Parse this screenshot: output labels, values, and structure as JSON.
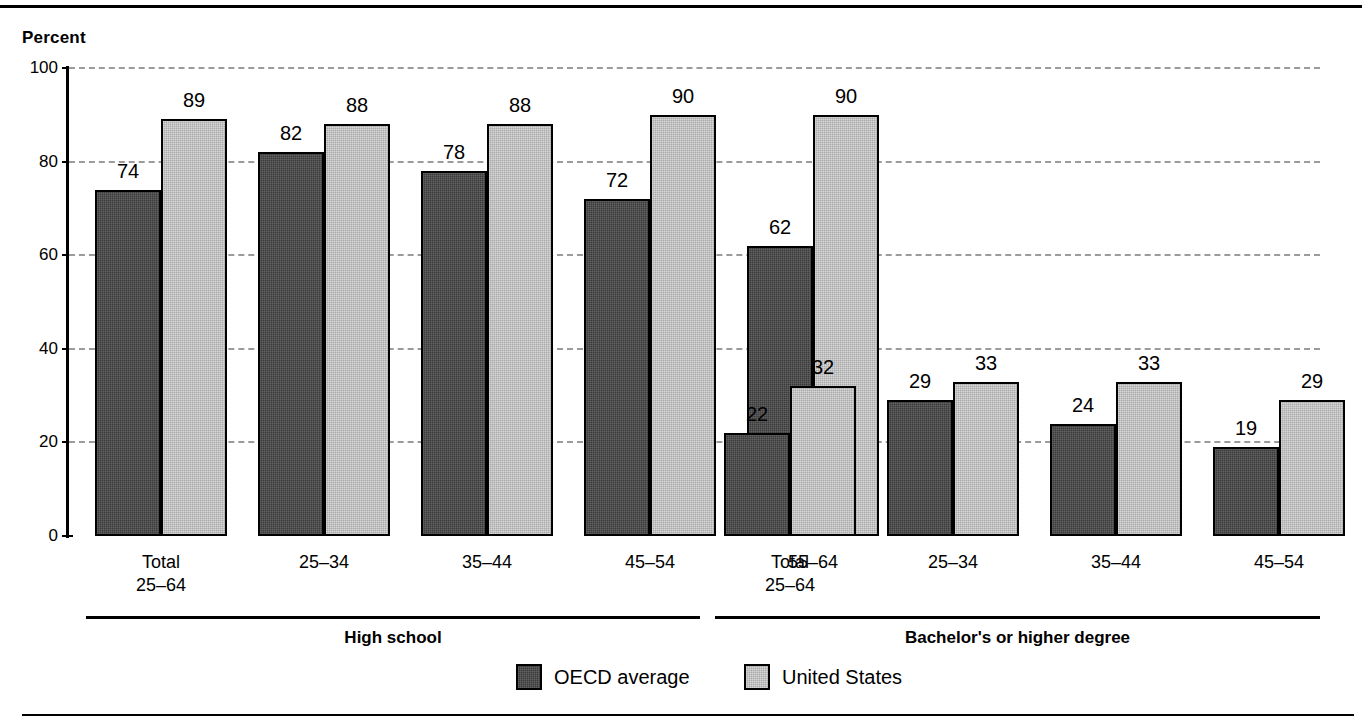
{
  "chart_data": {
    "type": "bar",
    "title": "",
    "xlabel": "",
    "ylabel": "Percent",
    "ylim": [
      0,
      100
    ],
    "yticks": [
      0,
      20,
      40,
      60,
      80,
      100
    ],
    "grid": "horizontal-dashed",
    "legend_position": "bottom-center",
    "categories": [
      "Total\n25–64",
      "25–34",
      "35–44",
      "45–54",
      "55–64",
      "Total\n25–64",
      "25–34",
      "35–44",
      "45–54",
      "55–64"
    ],
    "groups": [
      {
        "label": "High school",
        "categories": [
          "Total 25–64",
          "25–34",
          "35–44",
          "45–54",
          "55–64"
        ]
      },
      {
        "label": "Bachelor's or higher degree",
        "categories": [
          "Total 25–64",
          "25–34",
          "35–44",
          "45–54",
          "55–64"
        ]
      }
    ],
    "series": [
      {
        "name": "OECD average",
        "color": "#3b3b3b",
        "values": [
          74,
          82,
          78,
          72,
          62,
          22,
          29,
          24,
          19,
          16
        ]
      },
      {
        "name": "United States",
        "color": "#a9a9a9",
        "values": [
          89,
          88,
          88,
          90,
          90,
          32,
          33,
          33,
          29,
          32
        ]
      }
    ]
  },
  "axis": {
    "percent_label": "Percent",
    "y_tick_labels": [
      "100",
      "80",
      "60",
      "40",
      "20",
      "0"
    ]
  },
  "categories": [
    {
      "line1": "Total",
      "line2": "25–64"
    },
    {
      "line1": "25–34",
      "line2": ""
    },
    {
      "line1": "35–44",
      "line2": ""
    },
    {
      "line1": "45–54",
      "line2": ""
    },
    {
      "line1": "55–64",
      "line2": ""
    },
    {
      "line1": "Total",
      "line2": "25–64"
    },
    {
      "line1": "25–34",
      "line2": ""
    },
    {
      "line1": "35–44",
      "line2": ""
    },
    {
      "line1": "45–54",
      "line2": ""
    },
    {
      "line1": "55–64",
      "line2": ""
    }
  ],
  "group_labels": {
    "high_school": "High school",
    "bachelors": "Bachelor's or higher degree"
  },
  "legend": {
    "items": [
      {
        "label": "OECD average",
        "color": "#3b3b3b"
      },
      {
        "label": "United States",
        "color": "#a9a9a9"
      }
    ]
  },
  "bar_values": {
    "oecd": [
      "74",
      "82",
      "78",
      "72",
      "62",
      "22",
      "29",
      "24",
      "19",
      "16"
    ],
    "us": [
      "89",
      "88",
      "88",
      "90",
      "90",
      "32",
      "33",
      "33",
      "29",
      "32"
    ]
  }
}
